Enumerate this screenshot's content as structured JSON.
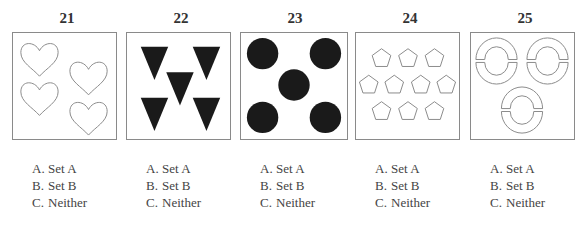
{
  "items": [
    {
      "number": "21",
      "figure": "four-outline-hearts",
      "options": [
        {
          "letter": "A.",
          "text": "Set A"
        },
        {
          "letter": "B.",
          "text": "Set B"
        },
        {
          "letter": "C.",
          "text": "Neither"
        }
      ]
    },
    {
      "number": "22",
      "figure": "five-filled-down-triangles",
      "options": [
        {
          "letter": "A.",
          "text": "Set A"
        },
        {
          "letter": "B.",
          "text": "Set B"
        },
        {
          "letter": "C.",
          "text": "Neither"
        }
      ]
    },
    {
      "number": "23",
      "figure": "five-filled-circles",
      "options": [
        {
          "letter": "A.",
          "text": "Set A"
        },
        {
          "letter": "B.",
          "text": "Set B"
        },
        {
          "letter": "C.",
          "text": "Neither"
        }
      ]
    },
    {
      "number": "24",
      "figure": "ten-outline-pentagons",
      "options": [
        {
          "letter": "A.",
          "text": "Set A"
        },
        {
          "letter": "B.",
          "text": "Set B"
        },
        {
          "letter": "C.",
          "text": "Neither"
        }
      ]
    },
    {
      "number": "25",
      "figure": "three-split-rings",
      "options": [
        {
          "letter": "A.",
          "text": "Set A"
        },
        {
          "letter": "B.",
          "text": "Set B"
        },
        {
          "letter": "C.",
          "text": "Neither"
        }
      ]
    }
  ],
  "colors": {
    "stroke": "#8a8a8a",
    "fill": "#1a1a1a",
    "text": "#333333"
  }
}
